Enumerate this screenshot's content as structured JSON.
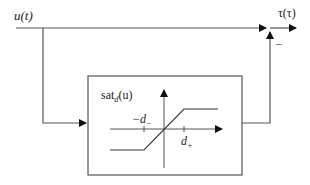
{
  "diagram": {
    "input_label": "u(t)",
    "output_label": "τ(τ)",
    "sum_sign": "–",
    "block": {
      "title_main": "sat",
      "title_sub": "d",
      "title_arg": "(u)",
      "neg_threshold_label": "−d",
      "neg_threshold_sub": "−",
      "pos_threshold_label": "d",
      "pos_threshold_sub": "+"
    },
    "colors": {
      "line": "#555555",
      "arrow": "#111111"
    }
  }
}
